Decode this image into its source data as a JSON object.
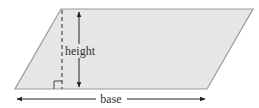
{
  "diagram": {
    "shape": "parallelogram",
    "labels": {
      "height": "height",
      "base": "base"
    },
    "colors": {
      "fill": "#e6e6e6",
      "stroke": "#9a9a9a",
      "arrow": "#222222",
      "dashed": "#555555",
      "text": "#333333"
    },
    "annotations": [
      "right-angle marker",
      "dashed altitude",
      "height double arrow",
      "base double arrow"
    ]
  }
}
